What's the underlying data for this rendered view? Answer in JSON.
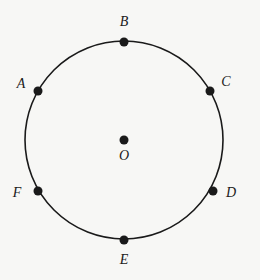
{
  "diagram": {
    "type": "circle-with-labeled-points",
    "canvas": {
      "width": 260,
      "height": 280
    },
    "background": "#f7f7f5",
    "ink_color": "#1a1a1a",
    "circle": {
      "cx": 124,
      "cy": 140,
      "r": 99,
      "stroke_width": 1.6
    },
    "point_radius": 4.5,
    "center": {
      "name": "O",
      "x": 124,
      "y": 140,
      "label_x": 124,
      "label_y": 160
    },
    "points": [
      {
        "name": "A",
        "x": 38,
        "y": 91,
        "label_x": 21,
        "label_y": 88
      },
      {
        "name": "B",
        "x": 124,
        "y": 42,
        "label_x": 124,
        "label_y": 26
      },
      {
        "name": "C",
        "x": 210,
        "y": 91,
        "label_x": 226,
        "label_y": 86
      },
      {
        "name": "D",
        "x": 213,
        "y": 191,
        "label_x": 231,
        "label_y": 197
      },
      {
        "name": "E",
        "x": 124,
        "y": 240,
        "label_x": 124,
        "label_y": 264
      },
      {
        "name": "F",
        "x": 38,
        "y": 191,
        "label_x": 17,
        "label_y": 197
      }
    ]
  }
}
